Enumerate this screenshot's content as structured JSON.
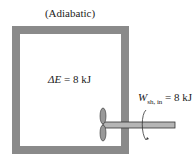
{
  "diagram": {
    "title": "(Adiabatic)",
    "energy_change": {
      "symbol": "ΔE",
      "value": "= 8 kJ"
    },
    "shaft_work": {
      "symbol": "W",
      "subscript": "sh, in",
      "value": "= 8 kJ"
    },
    "colors": {
      "wall": "#8a8a8a",
      "shaft": "#b0b0b0"
    }
  }
}
